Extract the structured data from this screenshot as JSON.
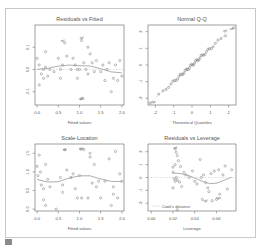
{
  "chart_data": [
    {
      "type": "scatter",
      "title": "Residuals vs Fitted",
      "xlabel": "Fitted values",
      "ylabel": "",
      "xlim": [
        -0.05,
        2.05
      ],
      "ylim": [
        -0.16,
        0.2
      ],
      "xticks": [
        "0.0",
        "0.5",
        "1.0",
        "1.5",
        "2.0"
      ],
      "yticks": [
        "0.1",
        "0.0",
        "-0.1"
      ],
      "annotations": [
        "ref",
        "rpf",
        "rpf2"
      ],
      "smoother": true,
      "points": [
        [
          0.0,
          0.05
        ],
        [
          0.05,
          -0.07
        ],
        [
          0.05,
          0.02
        ],
        [
          0.1,
          -0.02
        ],
        [
          0.15,
          0.0
        ],
        [
          0.15,
          -0.04
        ],
        [
          0.2,
          0.08
        ],
        [
          0.2,
          0.01
        ],
        [
          0.25,
          -0.03
        ],
        [
          0.3,
          0.0
        ],
        [
          0.4,
          -0.01
        ],
        [
          0.5,
          0.05
        ],
        [
          0.55,
          -0.04
        ],
        [
          0.55,
          0.0
        ],
        [
          0.6,
          0.02
        ],
        [
          0.65,
          0.12
        ],
        [
          0.7,
          0.06
        ],
        [
          0.8,
          0.0
        ],
        [
          0.85,
          0.05
        ],
        [
          0.9,
          0.02
        ],
        [
          0.95,
          -0.04
        ],
        [
          1.0,
          0.0
        ],
        [
          1.05,
          0.13
        ],
        [
          1.1,
          0.03
        ],
        [
          1.15,
          0.0
        ],
        [
          1.2,
          0.1
        ],
        [
          1.2,
          -0.02
        ],
        [
          1.25,
          0.07
        ],
        [
          1.3,
          0.03
        ],
        [
          1.35,
          -0.01
        ],
        [
          1.4,
          0.04
        ],
        [
          1.5,
          -0.01
        ],
        [
          1.55,
          0.02
        ],
        [
          1.6,
          -0.05
        ],
        [
          1.65,
          0.0
        ],
        [
          1.7,
          0.03
        ],
        [
          1.75,
          -0.1
        ],
        [
          1.8,
          -0.04
        ],
        [
          1.85,
          0.02
        ],
        [
          1.9,
          -0.05
        ],
        [
          1.95,
          0.04
        ],
        [
          2.0,
          -0.03
        ],
        [
          1.05,
          -0.13
        ],
        [
          0.95,
          0.0
        ]
      ]
    },
    {
      "type": "scatter",
      "title": "Normal Q-Q",
      "xlabel": "Theoretical Quantiles",
      "ylabel": "",
      "xlim": [
        -2.4,
        2.4
      ],
      "ylim": [
        -2.4,
        2.4
      ],
      "xticks": [
        "-2",
        "-1",
        "0",
        "1",
        "2"
      ],
      "yticks": [
        "2",
        "1",
        "0",
        "-1",
        "-2"
      ],
      "annotations": [
        "rpf",
        "ref",
        "xyz"
      ],
      "reference_line": true
    },
    {
      "type": "scatter",
      "title": "Scale-Location",
      "xlabel": "Fitted values",
      "ylabel": "",
      "xlim": [
        -0.05,
        2.05
      ],
      "ylim": [
        -0.05,
        1.75
      ],
      "xticks": [
        "0.0",
        "0.5",
        "1.0",
        "1.5",
        "2.0"
      ],
      "yticks": [
        "1.5",
        "1.0",
        "0.5",
        "0.0"
      ],
      "annotations": [
        "ref",
        "rpf"
      ],
      "smoother": true,
      "points": [
        [
          0.0,
          1.15
        ],
        [
          0.02,
          0.9
        ],
        [
          0.05,
          1.45
        ],
        [
          0.08,
          1.0
        ],
        [
          0.1,
          0.65
        ],
        [
          0.15,
          0.55
        ],
        [
          0.15,
          0.25
        ],
        [
          0.2,
          1.2
        ],
        [
          0.2,
          0.1
        ],
        [
          0.25,
          0.8
        ],
        [
          0.3,
          0.6
        ],
        [
          0.45,
          0.0
        ],
        [
          0.55,
          0.85
        ],
        [
          0.6,
          0.65
        ],
        [
          0.6,
          0.45
        ],
        [
          0.65,
          1.6
        ],
        [
          0.7,
          1.05
        ],
        [
          0.8,
          0.85
        ],
        [
          0.85,
          0.95
        ],
        [
          0.9,
          0.55
        ],
        [
          0.95,
          0.3
        ],
        [
          1.0,
          0.9
        ],
        [
          1.05,
          0.3
        ],
        [
          1.1,
          1.6
        ],
        [
          1.2,
          0.3
        ],
        [
          1.25,
          1.5
        ],
        [
          1.25,
          1.4
        ],
        [
          1.3,
          0.7
        ],
        [
          1.35,
          1.2
        ],
        [
          1.4,
          0.6
        ],
        [
          1.45,
          0.75
        ],
        [
          1.5,
          0.3
        ],
        [
          1.6,
          0.75
        ],
        [
          1.7,
          1.35
        ],
        [
          1.75,
          0.1
        ],
        [
          1.8,
          0.6
        ],
        [
          1.8,
          0.4
        ],
        [
          1.85,
          1.55
        ],
        [
          1.9,
          0.3
        ],
        [
          1.95,
          0.95
        ],
        [
          2.0,
          0.75
        ],
        [
          1.02,
          1.62
        ]
      ]
    },
    {
      "type": "scatter",
      "title": "Residuals vs Leverage",
      "xlabel": "Leverage",
      "ylabel": "",
      "xlim": [
        -0.003,
        0.078
      ],
      "ylim": [
        -2.6,
        2.6
      ],
      "xticks": [
        "0.00",
        "0.02",
        "0.04",
        "0.06"
      ],
      "yticks": [
        "2",
        "1",
        "0",
        "-1",
        "-2"
      ],
      "legend": [
        "Cook's distance"
      ],
      "annotations": [
        "rpf",
        "xyz",
        "ref"
      ],
      "smoother": true,
      "points": [
        [
          0.022,
          2.2
        ],
        [
          0.023,
          1.95
        ],
        [
          0.024,
          1.7
        ],
        [
          0.02,
          0.8
        ],
        [
          0.022,
          1.0
        ],
        [
          0.025,
          1.3
        ],
        [
          0.027,
          0.85
        ],
        [
          0.03,
          0.4
        ],
        [
          0.02,
          0.4
        ],
        [
          0.021,
          -0.1
        ],
        [
          0.022,
          -0.3
        ],
        [
          0.023,
          0.0
        ],
        [
          0.024,
          -0.2
        ],
        [
          0.026,
          -0.35
        ],
        [
          0.02,
          -0.8
        ],
        [
          0.028,
          -0.7
        ],
        [
          0.032,
          0.2
        ],
        [
          0.035,
          0.0
        ],
        [
          0.038,
          0.5
        ],
        [
          0.04,
          -0.3
        ],
        [
          0.042,
          -0.5
        ],
        [
          0.045,
          1.4
        ],
        [
          0.046,
          0.0
        ],
        [
          0.048,
          0.2
        ],
        [
          0.05,
          -0.4
        ],
        [
          0.052,
          -0.8
        ],
        [
          0.053,
          -1.1
        ],
        [
          0.055,
          0.3
        ],
        [
          0.056,
          -1.8
        ],
        [
          0.058,
          0.5
        ],
        [
          0.06,
          -1.7
        ],
        [
          0.062,
          0.6
        ],
        [
          0.063,
          -1.3
        ],
        [
          0.066,
          0.2
        ],
        [
          0.068,
          0.9
        ],
        [
          0.07,
          -0.9
        ],
        [
          0.074,
          0.6
        ],
        [
          0.047,
          -1.7
        ],
        [
          0.024,
          -2.5
        ]
      ]
    }
  ]
}
